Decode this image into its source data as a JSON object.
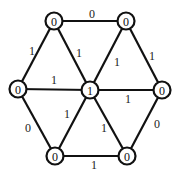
{
  "diagram": {
    "type": "hexagonal-wheel-graph",
    "nodes": [
      {
        "id": "top-left",
        "x": 54,
        "y": 21,
        "label": "0"
      },
      {
        "id": "top-right",
        "x": 126,
        "y": 21,
        "label": "0"
      },
      {
        "id": "left",
        "x": 18,
        "y": 89,
        "label": "0"
      },
      {
        "id": "center",
        "x": 90,
        "y": 90,
        "label": "1"
      },
      {
        "id": "right",
        "x": 162,
        "y": 90,
        "label": "0"
      },
      {
        "id": "bottom-left",
        "x": 55,
        "y": 156,
        "label": "0"
      },
      {
        "id": "bottom-right",
        "x": 127,
        "y": 156,
        "label": "0"
      }
    ],
    "edges": [
      {
        "from": "top-left",
        "to": "top-right",
        "label": "0",
        "lx": 92,
        "ly": 14
      },
      {
        "from": "top-left",
        "to": "left",
        "label": "1",
        "lx": 32,
        "ly": 51
      },
      {
        "from": "top-left",
        "to": "center",
        "label": "1",
        "lx": 79,
        "ly": 53
      },
      {
        "from": "top-right",
        "to": "center",
        "label": "1",
        "lx": 117,
        "ly": 62
      },
      {
        "from": "top-right",
        "to": "right",
        "label": "1",
        "lx": 152,
        "ly": 56
      },
      {
        "from": "left",
        "to": "center",
        "label": "1",
        "lx": 54,
        "ly": 80
      },
      {
        "from": "center",
        "to": "right",
        "label": "1",
        "lx": 128,
        "ly": 99
      },
      {
        "from": "left",
        "to": "bottom-left",
        "label": "0",
        "lx": 28,
        "ly": 128
      },
      {
        "from": "center",
        "to": "bottom-left",
        "label": "1",
        "lx": 67,
        "ly": 114
      },
      {
        "from": "center",
        "to": "bottom-right",
        "label": "1",
        "lx": 104,
        "ly": 128
      },
      {
        "from": "right",
        "to": "bottom-right",
        "label": "0",
        "lx": 157,
        "ly": 124
      },
      {
        "from": "bottom-left",
        "to": "bottom-right",
        "label": "1",
        "lx": 94,
        "ly": 165
      }
    ],
    "node_radius": 8.5,
    "colors": {
      "stroke": "#111111",
      "fill": "#ffffff",
      "text": "#111111"
    }
  }
}
